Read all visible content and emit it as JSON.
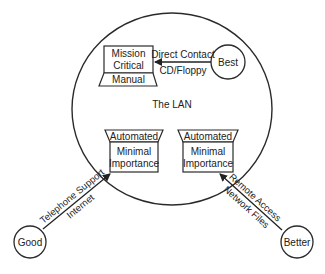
{
  "diagram": {
    "lan_label": "The LAN",
    "mission_box": {
      "line1": "Mission",
      "line2": "Critical",
      "base": "Manual"
    },
    "left_box": {
      "top": "Automated",
      "line1": "Minimal",
      "line2": "Importance"
    },
    "right_box": {
      "top": "Automated",
      "line1": "Minimal",
      "line2": "Importance"
    },
    "nodes": {
      "best": "Best",
      "good": "Good",
      "better": "Better"
    },
    "edges": {
      "best": {
        "above": "Direct Contact",
        "below": "CD/Floppy"
      },
      "good": {
        "above": "Telephone Support",
        "below": "Internet"
      },
      "better": {
        "above": "Remote Access",
        "below": "Network Files"
      }
    },
    "colors": {
      "stroke": "#2a2a2a",
      "background": "#ffffff"
    }
  }
}
